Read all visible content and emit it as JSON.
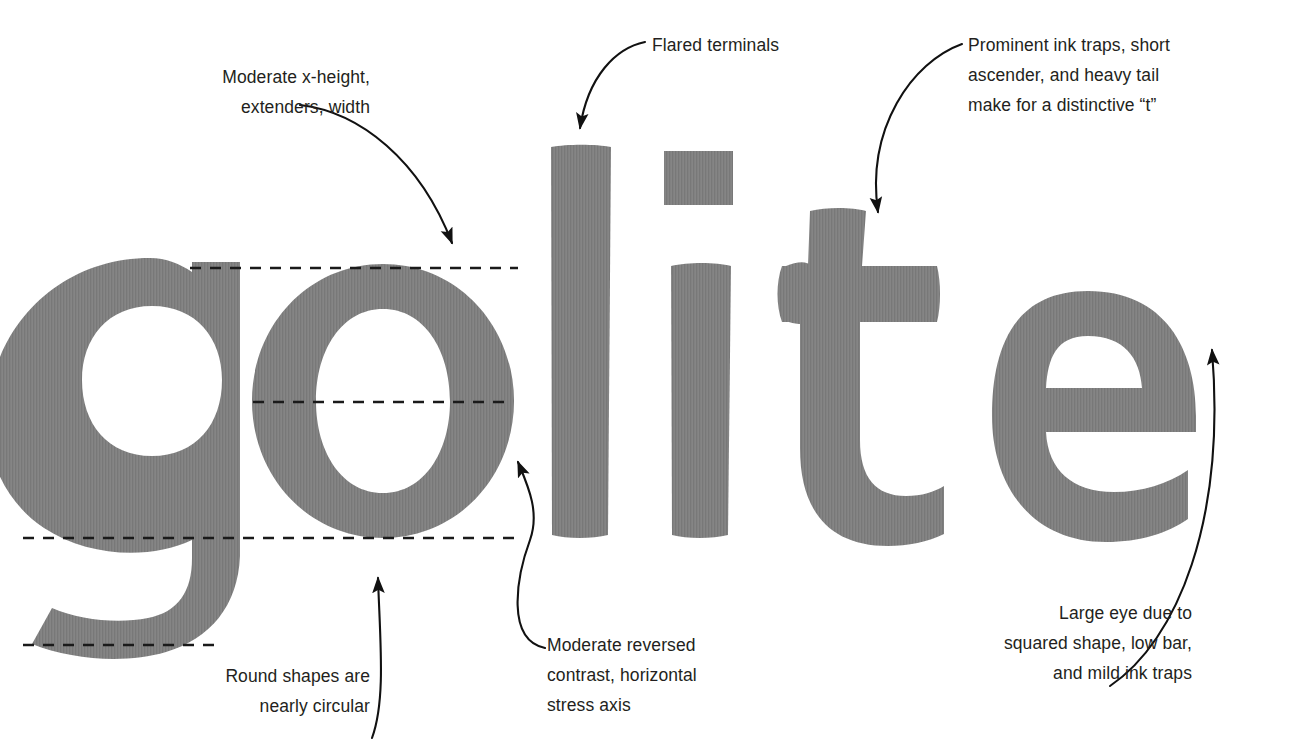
{
  "figure": {
    "specimen_word": "golite",
    "background_color": "#ffffff",
    "glyph_color": "#808080",
    "glyph_texture": "fine vertical stripes",
    "annotation_text_color": "#231f20",
    "guide_line_color": "#1a1a1a",
    "guide_line_style": "dashed"
  },
  "glyphs": [
    {
      "char": "g",
      "name": "glyph-g",
      "description": "single-story g with bowl and descending hook"
    },
    {
      "char": "o",
      "name": "glyph-o",
      "description": "nearly circular o with reversed contrast"
    },
    {
      "char": "l",
      "name": "glyph-l",
      "description": "plain stem with flared terminals"
    },
    {
      "char": "i",
      "name": "glyph-i",
      "description": "stem with square dot"
    },
    {
      "char": "t",
      "name": "glyph-t",
      "description": "short ascender, heavy crossbar with ink traps, heavy tail"
    },
    {
      "char": "e",
      "name": "glyph-e",
      "description": "large squared eye with low bar"
    }
  ],
  "guides": [
    {
      "id": "x-height-line",
      "label": "x-height"
    },
    {
      "id": "mid-line",
      "label": "mid-line"
    },
    {
      "id": "baseline",
      "label": "baseline"
    },
    {
      "id": "descender-line",
      "label": "descender"
    }
  ],
  "annotations": {
    "x_height": "Moderate x-height,\nextenders, width",
    "flared_terminals": "Flared terminals",
    "ink_traps": "Prominent ink traps, short\nascender, and heavy tail\nmake for a distinctive “t”",
    "reversed_contrast": "Moderate reversed\ncontrast, horizontal\nstress axis",
    "round_shapes": "Round shapes are\nnearly circular",
    "large_eye": "Large eye due to\nsquared shape, low bar,\nand mild ink traps"
  }
}
